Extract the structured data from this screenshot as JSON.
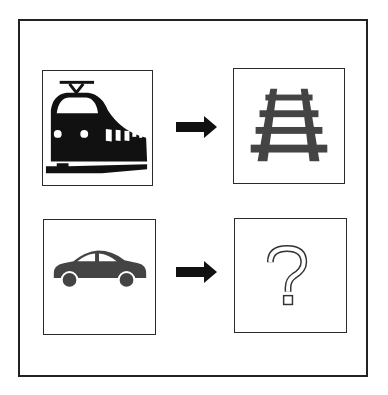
{
  "rows": [
    {
      "left": {
        "icon": "train-icon",
        "label": "Train"
      },
      "relation": "arrow-right-icon",
      "right": {
        "icon": "railway-track-icon",
        "label": "Railway track"
      }
    },
    {
      "left": {
        "icon": "car-icon",
        "label": "Car"
      },
      "relation": "arrow-right-icon",
      "right": {
        "icon": "question-mark-icon",
        "label": "?"
      }
    }
  ],
  "colors": {
    "frame": "#222222",
    "icon_dark": "#111111",
    "icon_grey": "#444444"
  }
}
